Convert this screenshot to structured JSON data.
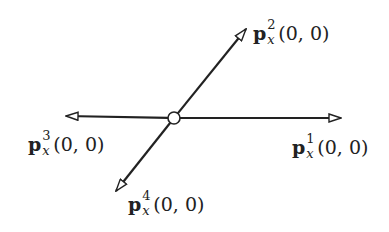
{
  "diagram": {
    "center": {
      "x": 174,
      "y": 118,
      "radius": 6
    },
    "colors": {
      "stroke": "#222222",
      "fill": "#ffffff"
    },
    "arrows": [
      {
        "id": "p1",
        "tip": {
          "x": 341,
          "y": 118
        }
      },
      {
        "id": "p2",
        "tip": {
          "x": 246,
          "y": 29
        }
      },
      {
        "id": "p3",
        "tip": {
          "x": 66,
          "y": 116
        }
      },
      {
        "id": "p4",
        "tip": {
          "x": 116,
          "y": 191
        }
      }
    ],
    "labels": [
      {
        "id": "p1",
        "vector": "p",
        "superscript": "1",
        "subscript": "x",
        "args": "(0, 0)"
      },
      {
        "id": "p2",
        "vector": "p",
        "superscript": "2",
        "subscript": "x",
        "args": "(0, 0)"
      },
      {
        "id": "p3",
        "vector": "p",
        "superscript": "3",
        "subscript": "x",
        "args": "(0, 0)"
      },
      {
        "id": "p4",
        "vector": "p",
        "superscript": "4",
        "subscript": "x",
        "args": "(0, 0)"
      }
    ]
  }
}
